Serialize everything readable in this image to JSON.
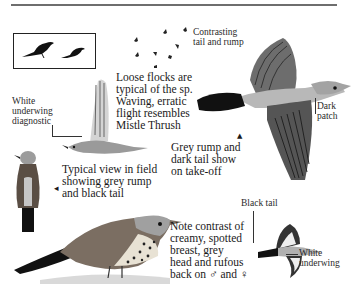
{
  "page": {
    "top_rule": true
  },
  "annotations": {
    "loose_flocks": "Loose flocks are\ntypical of the sp.\nWaving, erratic\nflight resembles\nMistle Thrush",
    "contrasting": "Contrasting\ntail and rump",
    "white_underwing_diag": "White\nunderwing\ndiagnostic",
    "dark_patch": "Dark\npatch",
    "grey_rump": "Grey rump and\ndark tail show\non take-off",
    "typical_view": "Typical view in field\nshowing grey rump\nand black tail",
    "black_tail": "Black tail",
    "note_contrast": "Note contrast of\ncreamy, spotted\nbreast, grey\nhead and rufous\nback on ♂ and ♀",
    "white_underwing": "White\nunderwing"
  },
  "markers": {
    "arrow_typical": "◂",
    "arrow_grey_rump": "▲"
  },
  "colors": {
    "ink": "#1a1a1a",
    "rule": "#6e6e6e",
    "grey_plumage": "#a9a9a9",
    "dark_plumage": "#3a3a3a",
    "rufous": "#7a6a5a",
    "cream": "#e8e2d4"
  }
}
